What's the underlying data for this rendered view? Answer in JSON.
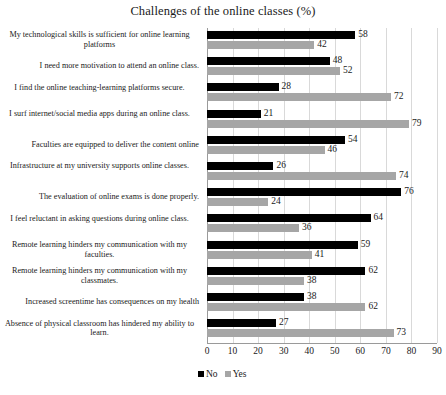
{
  "chart_data": {
    "type": "bar",
    "orientation": "horizontal",
    "title": "Challenges of the online classes (%)",
    "xlabel": "",
    "ylabel": "",
    "xlim": [
      0,
      90
    ],
    "xticks": [
      0,
      10,
      20,
      30,
      40,
      50,
      60,
      70,
      80,
      90
    ],
    "grid": true,
    "grid_axis": "x",
    "legend_position": "bottom-left",
    "categories": [
      "My technological skills is sufficient for online learning platforms",
      "I need more motivation to attend an online class.",
      "I find the online teaching-learning platforms secure.",
      "I surf internet/social media apps during an online class.",
      "Faculties are equipped to deliver the content online",
      "Infrastructure at my university  supports online classes.",
      "The evaluation of online exams is done properly.",
      "I feel reluctant in asking questions during online class.",
      "Remote learning hinders my communication with my faculties.",
      "Remote learning hinders my communication with my classmates.",
      "Increased screentime has consequences on my health",
      "Absence of physical classroom has hindered my ability to learn."
    ],
    "series": [
      {
        "name": "No",
        "color": "#000000",
        "values": [
          58,
          48,
          28,
          21,
          54,
          26,
          76,
          64,
          59,
          62,
          38,
          27
        ]
      },
      {
        "name": "Yes",
        "color": "#a6a6a6",
        "values": [
          42,
          52,
          72,
          79,
          46,
          74,
          24,
          36,
          41,
          38,
          62,
          73
        ]
      }
    ]
  },
  "legend": {
    "items": [
      {
        "label": "No",
        "color": "#000000"
      },
      {
        "label": "Yes",
        "color": "#a6a6a6"
      }
    ]
  }
}
